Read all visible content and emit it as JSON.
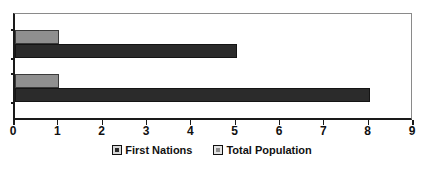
{
  "chart_data": {
    "type": "bar",
    "orientation": "horizontal",
    "title": "",
    "subtitle": "",
    "xlabel": "",
    "ylabel": "",
    "categories": [
      "",
      ""
    ],
    "series": [
      {
        "name": "First Nations",
        "color": "#2b2b2b",
        "values": [
          5,
          8
        ]
      },
      {
        "name": "Total Population",
        "color": "#8f8f8f",
        "values": [
          1,
          1
        ]
      }
    ],
    "xlim": [
      0,
      9
    ],
    "xticks": [
      0,
      1,
      2,
      3,
      4,
      5,
      6,
      7,
      8,
      9
    ],
    "xtick_labels": [
      "0",
      "1",
      "2",
      "3",
      "4",
      "5",
      "6",
      "7",
      "8",
      "9"
    ],
    "grid": false,
    "legend_position": "bottom",
    "plot_border_color": "#8a8a8a",
    "axis_color": "#1a1a1a",
    "background": "#ffffff"
  },
  "axis": {
    "ticks": [
      {
        "label": "0",
        "value": 0
      },
      {
        "label": "1",
        "value": 1
      },
      {
        "label": "2",
        "value": 2
      },
      {
        "label": "3",
        "value": 3
      },
      {
        "label": "4",
        "value": 4
      },
      {
        "label": "5",
        "value": 5
      },
      {
        "label": "6",
        "value": 6
      },
      {
        "label": "7",
        "value": 7
      },
      {
        "label": "8",
        "value": 8
      },
      {
        "label": "9",
        "value": 9
      }
    ]
  },
  "legend": {
    "items": [
      {
        "label": "First Nations",
        "color": "#2b2b2b"
      },
      {
        "label": "Total Population",
        "color": "#8f8f8f"
      }
    ]
  }
}
